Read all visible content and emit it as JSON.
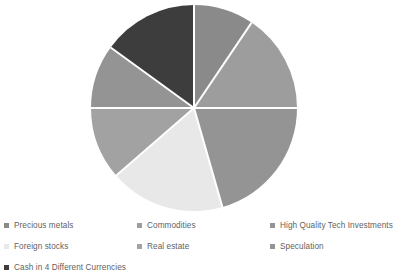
{
  "chart_data": {
    "type": "pie",
    "title": "",
    "subtitle": "",
    "xlabel": "",
    "ylabel": "",
    "grid": false,
    "legend_position": "bottom",
    "legend_columns": 3,
    "start_angle_deg": 0,
    "direction": "clockwise",
    "center": {
      "x": 194,
      "y": 108
    },
    "radius": 103,
    "separator_color": "#ffffff",
    "categories": [
      "Precious metals",
      "Commodities",
      "High Quality Tech Investments",
      "Foreign stocks",
      "Real estate",
      "Speculation",
      "Cash in 4 Different Currencies"
    ],
    "values": [
      9.4,
      15.6,
      20.6,
      18.1,
      11.4,
      10.0,
      15.0
    ],
    "angles_deg": [
      34,
      56,
      74,
      65,
      41,
      36,
      54
    ],
    "colors": [
      "#8a8a8a",
      "#9d9d9d",
      "#949494",
      "#e8e8e8",
      "#a2a2a2",
      "#949494",
      "#3d3d3d"
    ],
    "slices": [
      {
        "label": "Precious metals",
        "value": 9.4,
        "angle_deg": 34,
        "start_deg": 0,
        "end_deg": 34,
        "color": "#8a8a8a"
      },
      {
        "label": "Commodities",
        "value": 15.6,
        "angle_deg": 56,
        "start_deg": 34,
        "end_deg": 90,
        "color": "#9d9d9d"
      },
      {
        "label": "High Quality Tech Investments",
        "value": 20.6,
        "angle_deg": 74,
        "start_deg": 90,
        "end_deg": 164,
        "color": "#949494"
      },
      {
        "label": "Foreign stocks",
        "value": 18.1,
        "angle_deg": 65,
        "start_deg": 164,
        "end_deg": 229,
        "color": "#e8e8e8"
      },
      {
        "label": "Real estate",
        "value": 11.4,
        "angle_deg": 41,
        "start_deg": 229,
        "end_deg": 270,
        "color": "#a2a2a2"
      },
      {
        "label": "Speculation",
        "value": 10.0,
        "angle_deg": 36,
        "start_deg": 270,
        "end_deg": 306,
        "color": "#949494"
      },
      {
        "label": "Cash in 4 Different Currencies",
        "value": 15.0,
        "angle_deg": 54,
        "start_deg": 306,
        "end_deg": 360,
        "color": "#3d3d3d"
      }
    ]
  },
  "legend": {
    "items": [
      {
        "label": "Precious metals",
        "color": "#8a8a8a"
      },
      {
        "label": "Commodities",
        "color": "#9d9d9d"
      },
      {
        "label": "High Quality Tech Investments",
        "color": "#949494"
      },
      {
        "label": "Foreign stocks",
        "color": "#e8e8e8"
      },
      {
        "label": "Real estate",
        "color": "#a2a2a2"
      },
      {
        "label": "Speculation",
        "color": "#949494"
      },
      {
        "label": "Cash in 4 Different Currencies",
        "color": "#3d3d3d"
      }
    ]
  }
}
